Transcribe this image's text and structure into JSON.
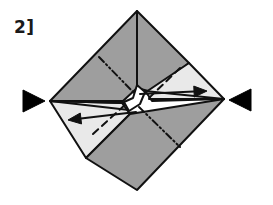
{
  "figure": {
    "kind": "origami-fold-diagram",
    "step_label": "2]",
    "title": "Origami fold step 2"
  },
  "colors": {
    "background": "#ffffff",
    "paper_dark": "#9e9e9e",
    "paper_light": "#e9e9e9",
    "paper_white": "#ffffff",
    "outline": "#111111",
    "marker": "#000000"
  },
  "geometry": {
    "diamond": {
      "top": [
        137,
        11
      ],
      "right": [
        224,
        99
      ],
      "bottom": [
        137,
        190
      ],
      "left": [
        50,
        101
      ],
      "center": [
        137,
        101
      ]
    },
    "panels": [
      {
        "name": "top-left-dark-panel",
        "shade": "dark",
        "points": "137,11 50,101 123,101 137,88"
      },
      {
        "name": "top-right-dark-panel",
        "shade": "dark",
        "points": "137,11 189,63 152,92 137,88"
      },
      {
        "name": "upper-right-light-panel",
        "shade": "light",
        "points": "189,63 224,99 152,101 146,92"
      },
      {
        "name": "lower-left-light-panel",
        "shade": "light",
        "points": "50,101 122,103 130,114 86,158"
      },
      {
        "name": "bottom-right-dark-panel",
        "shade": "dark",
        "points": "137,190 86,158 130,114 224,99"
      },
      {
        "name": "center-white-wedge",
        "shade": "white",
        "points": "137,85 145,92 140,104 129,111 124,102 133,98"
      }
    ],
    "fold_lines": [
      {
        "name": "upper-left-dashdotdot-crease",
        "style": "dash-dot-dot",
        "x1": 99,
        "y1": 57,
        "x2": 137,
        "y2": 96
      },
      {
        "name": "lower-right-dashdotdot-crease",
        "style": "dash-dot-dot",
        "x1": 139,
        "y1": 107,
        "x2": 180,
        "y2": 147
      },
      {
        "name": "upper-right-dashed-crease",
        "style": "dashed",
        "x1": 180,
        "y1": 68,
        "x2": 149,
        "y2": 98
      },
      {
        "name": "lower-left-dashed-crease",
        "style": "dashed",
        "x1": 93,
        "y1": 134,
        "x2": 126,
        "y2": 104
      }
    ],
    "action_arrows": [
      {
        "name": "left-fold-arrow",
        "direction": "left",
        "tail": [
          136,
          112
        ],
        "head": [
          68,
          120
        ]
      },
      {
        "name": "right-fold-arrow",
        "direction": "right",
        "tail": [
          140,
          94
        ],
        "head": [
          207,
          91
        ]
      }
    ],
    "pointer_markers": [
      {
        "name": "left-pointer-marker",
        "direction": "right",
        "points": "23,90 45,101 23,112"
      },
      {
        "name": "right-pointer-marker",
        "direction": "left",
        "points": "251,89 229,100 251,111"
      }
    ],
    "guide_lines": [
      {
        "name": "left-upper-guide",
        "x1": 50,
        "y1": 101,
        "x2": 129,
        "y2": 110
      },
      {
        "name": "left-lower-guide",
        "x1": 50,
        "y1": 101,
        "x2": 124,
        "y2": 103
      },
      {
        "name": "right-upper-guide",
        "x1": 224,
        "y1": 99,
        "x2": 145,
        "y2": 91
      },
      {
        "name": "right-lower-guide",
        "x1": 224,
        "y1": 99,
        "x2": 149,
        "y2": 99
      }
    ]
  }
}
